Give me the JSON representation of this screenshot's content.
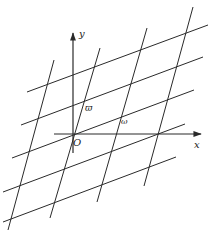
{
  "diagram": {
    "labels": {
      "y_axis": "y",
      "x_axis": "x",
      "origin": "O",
      "varpi": "ϖ",
      "omega": "ω"
    },
    "colors": {
      "line": "#2a2a2a",
      "background": "#ffffff"
    },
    "axes": {
      "origin": [
        73,
        134
      ],
      "x_axis": {
        "from": [
          54,
          134
        ],
        "to": [
          201,
          134
        ]
      },
      "y_axis": {
        "from": [
          73,
          153
        ],
        "to": [
          73,
          33
        ]
      }
    },
    "steep_lines": [
      {
        "from": [
          54,
          60
        ],
        "to": [
          8,
          230
        ]
      },
      {
        "from": [
          100,
          48
        ],
        "to": [
          50,
          218
        ]
      },
      {
        "from": [
          147,
          28
        ],
        "to": [
          97,
          202
        ]
      },
      {
        "from": [
          193,
          7
        ],
        "to": [
          144,
          186
        ]
      }
    ],
    "shallow_lines": [
      {
        "from": [
          27,
          92
        ],
        "to": [
          208,
          25
        ]
      },
      {
        "from": [
          21,
          125
        ],
        "to": [
          203,
          57
        ]
      },
      {
        "from": [
          12,
          158
        ],
        "to": [
          194,
          90
        ]
      },
      {
        "from": [
          3,
          192
        ],
        "to": [
          185,
          124
        ]
      },
      {
        "from": [
          3,
          222
        ],
        "to": [
          176,
          157
        ]
      }
    ]
  }
}
